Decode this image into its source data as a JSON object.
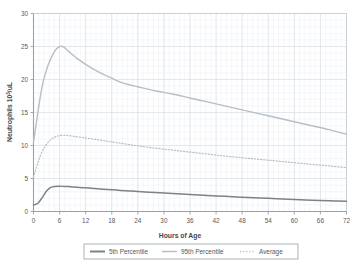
{
  "chart_data": {
    "type": "line",
    "title": "",
    "xlabel": "Hours of Age",
    "ylabel": "Neutrophils 10³/uL",
    "ylabel_main": "Neutrophils 10",
    "ylabel_exp": "3",
    "ylabel_tail": "/uL",
    "xlim": [
      0,
      72
    ],
    "ylim": [
      0,
      30
    ],
    "xticks": [
      0,
      6,
      12,
      18,
      24,
      30,
      36,
      42,
      48,
      54,
      60,
      66,
      72
    ],
    "yticks": [
      0,
      5,
      10,
      15,
      20,
      25,
      30
    ],
    "xtick_labels": [
      "0",
      "6",
      "12",
      "18",
      "24",
      "30",
      "36",
      "42",
      "48",
      "54",
      "60",
      "66",
      "72"
    ],
    "ytick_labels": [
      "0",
      "5",
      "10",
      "15",
      "20",
      "25",
      "30"
    ],
    "x_minor_step": 1.2,
    "y_minor_step": 1,
    "grid": true,
    "grid_color": "#d7dde6",
    "grid_minor_color": "#eaeef4",
    "axis_color": "#9aa0a6",
    "legend_position": "bottom",
    "series": [
      {
        "name": "5th Percentile",
        "style": "solid",
        "color": "#7c8287",
        "width": 1.5,
        "x": [
          0,
          1,
          2,
          3,
          4,
          5,
          6,
          7,
          8,
          9,
          10,
          12,
          14,
          16,
          18,
          20,
          22,
          24,
          28,
          32,
          36,
          40,
          44,
          48,
          52,
          56,
          60,
          64,
          68,
          72
        ],
        "y": [
          1.0,
          1.25,
          2.1,
          3.1,
          3.65,
          3.8,
          3.82,
          3.8,
          3.77,
          3.73,
          3.68,
          3.58,
          3.48,
          3.38,
          3.3,
          3.2,
          3.12,
          3.03,
          2.87,
          2.72,
          2.57,
          2.43,
          2.3,
          2.17,
          2.05,
          1.93,
          1.82,
          1.72,
          1.63,
          1.55
        ]
      },
      {
        "name": "95th Percentile",
        "style": "solid",
        "color": "#b9bec3",
        "width": 1.4,
        "x": [
          0,
          1,
          2,
          3,
          4,
          5,
          6,
          7,
          8,
          10,
          12,
          14,
          16,
          18,
          20,
          22,
          24,
          28,
          32,
          36,
          40,
          44,
          48,
          52,
          56,
          60,
          64,
          68,
          72
        ],
        "y": [
          10.5,
          15.0,
          19.0,
          21.5,
          23.2,
          24.4,
          25.0,
          24.9,
          24.3,
          23.2,
          22.3,
          21.5,
          20.8,
          20.2,
          19.6,
          19.2,
          18.9,
          18.3,
          17.8,
          17.2,
          16.6,
          16.0,
          15.4,
          14.8,
          14.2,
          13.6,
          13.0,
          12.4,
          11.7
        ]
      },
      {
        "name": "Average",
        "style": "dotted",
        "color": "#b9bec3",
        "width": 1.2,
        "x": [
          0,
          1,
          2,
          3,
          4,
          5,
          6,
          7,
          8,
          9,
          10,
          12,
          14,
          16,
          18,
          20,
          22,
          24,
          28,
          32,
          36,
          40,
          44,
          48,
          52,
          56,
          60,
          64,
          68,
          72
        ],
        "y": [
          5.2,
          7.4,
          9.1,
          10.2,
          10.9,
          11.3,
          11.5,
          11.55,
          11.5,
          11.42,
          11.33,
          11.15,
          10.95,
          10.75,
          10.55,
          10.35,
          10.15,
          9.95,
          9.6,
          9.3,
          9.0,
          8.7,
          8.4,
          8.15,
          7.9,
          7.65,
          7.4,
          7.15,
          6.9,
          6.65
        ]
      }
    ]
  },
  "legend": {
    "items": [
      {
        "label": "5th Percentile",
        "style": "solid",
        "color": "#7c8287"
      },
      {
        "label": "95th Percentile",
        "style": "solid",
        "color": "#b9bec3"
      },
      {
        "label": "Average",
        "style": "dotted",
        "color": "#b9bec3"
      }
    ],
    "border_color": "#9aa0a6"
  }
}
